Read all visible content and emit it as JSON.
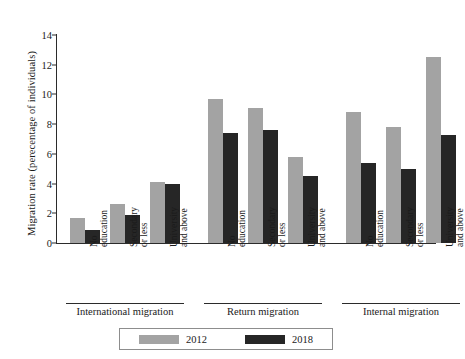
{
  "chart_data": {
    "type": "bar",
    "title": "",
    "xlabel": "",
    "ylabel": "Migration rate (perecentage of individuals)",
    "ylim": [
      0,
      14
    ],
    "yticks": [
      0,
      2,
      4,
      6,
      8,
      10,
      12,
      14
    ],
    "grid": false,
    "legend_position": "bottom",
    "groups": [
      {
        "name": "International migration",
        "categories": [
          "No education",
          "Secondary or less",
          "University and above"
        ],
        "series": [
          {
            "name": "2012",
            "values": [
              1.7,
              2.6,
              4.1
            ]
          },
          {
            "name": "2018",
            "values": [
              0.9,
              1.9,
              4.0
            ]
          }
        ]
      },
      {
        "name": "Return migration",
        "categories": [
          "No education",
          "Secondary or less",
          "University and above"
        ],
        "series": [
          {
            "name": "2012",
            "values": [
              9.7,
              9.1,
              5.8
            ]
          },
          {
            "name": "2018",
            "values": [
              7.4,
              7.6,
              4.5
            ]
          }
        ]
      },
      {
        "name": "Internal migration",
        "categories": [
          "No education",
          "Secondary or less",
          "University and above"
        ],
        "series": [
          {
            "name": "2012",
            "values": [
              8.8,
              7.8,
              12.5
            ]
          },
          {
            "name": "2018",
            "values": [
              5.4,
              5.0,
              7.3
            ]
          }
        ]
      }
    ],
    "category_label_lines": [
      [
        "No",
        "education"
      ],
      [
        "Secondary",
        "or less"
      ],
      [
        "University",
        "and above"
      ]
    ],
    "legend": [
      {
        "label": "2012",
        "color": "#a3a3a3"
      },
      {
        "label": "2018",
        "color": "#262626"
      }
    ],
    "colors": {
      "series_2012": "#a3a3a3",
      "series_2018": "#262626",
      "axis": "#2b2b2b"
    }
  }
}
